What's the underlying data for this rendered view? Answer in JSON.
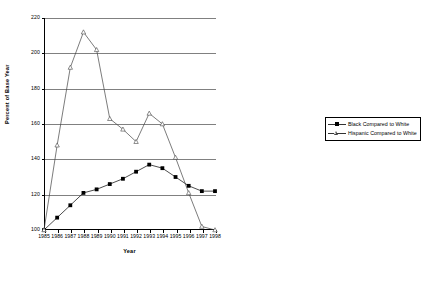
{
  "chart_data": {
    "type": "line",
    "title": "",
    "xlabel": "Year",
    "ylabel": "Percent of Base Year",
    "categories": [
      "1985",
      "1986",
      "1987",
      "1988",
      "1989",
      "1990",
      "1991",
      "1992",
      "1993",
      "1994",
      "1995",
      "1996",
      "1997",
      "1998"
    ],
    "x": [
      1985,
      1986,
      1987,
      1988,
      1989,
      1990,
      1991,
      1992,
      1993,
      1994,
      1995,
      1996,
      1997,
      1998
    ],
    "xlim": [
      1985,
      1998
    ],
    "ylim": [
      100,
      220
    ],
    "yticks": [
      100,
      120,
      140,
      160,
      180,
      200,
      220
    ],
    "grid": "horizontal",
    "legend_position": "right",
    "series": [
      {
        "name": "Black Compared to White",
        "marker": "filled-square",
        "color": "#000000",
        "values": [
          100,
          107,
          114,
          121,
          123,
          126,
          129,
          133,
          137,
          135,
          130,
          125,
          122,
          122
        ]
      },
      {
        "name": "Hispanic Compared to White",
        "marker": "open-triangle",
        "color": "#444444",
        "values": [
          100,
          148,
          192,
          212,
          202,
          163,
          157,
          150,
          166,
          160,
          141,
          121,
          102,
          100
        ]
      }
    ]
  },
  "axes": {
    "y_tick_labels": [
      "220",
      "200",
      "180",
      "160",
      "140",
      "120",
      "100"
    ],
    "x_tick_labels": [
      "1985",
      "1986",
      "1987",
      "1988",
      "1989",
      "1990",
      "1991",
      "1992",
      "1993",
      "1994",
      "1995",
      "1996",
      "1997",
      "1998"
    ],
    "y_axis_title": "Percent of Base Year",
    "x_axis_title": "Year"
  },
  "legend": {
    "items": [
      {
        "label": "Black Compared to White",
        "icon": "filled-square-marker"
      },
      {
        "label": "Hispanic Compared to White",
        "icon": "open-triangle-marker"
      }
    ]
  }
}
